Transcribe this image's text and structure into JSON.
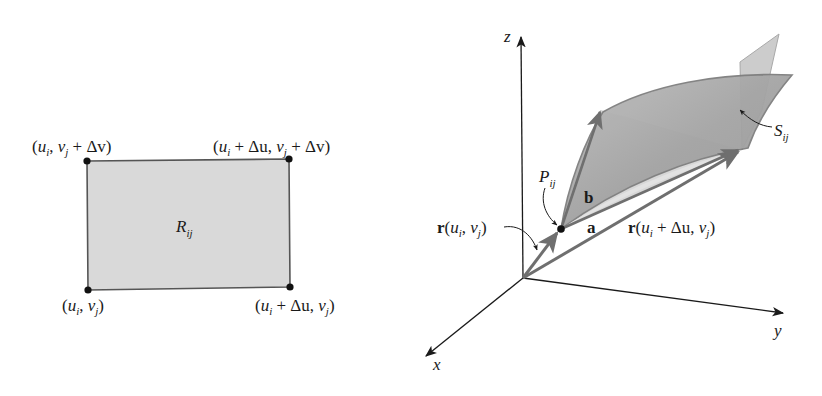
{
  "colors": {
    "ink": "#1a1a1a",
    "rect_fill": "#d9d9d9",
    "rect_stroke": "#555555",
    "surface_fill": "#a9a9a9",
    "surface_back_fill": "#c6c6c6",
    "tangent_fill": "#d0d0d0",
    "vector_gray": "#7a7a7a"
  },
  "left_panel": {
    "region_label": "R",
    "region_sub": "ij",
    "corners": {
      "top_left": {
        "open": "(",
        "u": "u",
        "u_sub": "i",
        "comma": ", ",
        "v": "v",
        "v_sub": "j",
        "rest": " + Δv)"
      },
      "top_right": {
        "open": "(",
        "u": "u",
        "u_sub": "i",
        "mid": " + Δu, ",
        "v": "v",
        "v_sub": "j",
        "rest": " + Δv)"
      },
      "bottom_left": {
        "open": "(",
        "u": "u",
        "u_sub": "i",
        "comma": ", ",
        "v": "v",
        "v_sub": "j",
        "rest": ")"
      },
      "bottom_right": {
        "open": "(",
        "u": "u",
        "u_sub": "i",
        "mid": " + Δu, ",
        "v": "v",
        "v_sub": "j",
        "rest": ")"
      }
    }
  },
  "right_panel": {
    "axes": {
      "x": "x",
      "y": "y",
      "z": "z"
    },
    "point_label": "P",
    "point_sub": "ij",
    "surface_label": "S",
    "surface_sub": "ij",
    "vector_a": "a",
    "vector_b": "b",
    "position_vector": {
      "r": "r",
      "open": "(",
      "u": "u",
      "u_sub": "i",
      "comma": ", ",
      "v": "v",
      "v_sub": "j",
      "close": ")"
    },
    "shifted_vector": {
      "r": "r",
      "open": "(",
      "u": "u",
      "u_sub": "i",
      "mid": " + Δu, ",
      "v": "v",
      "v_sub": "j",
      "close": ")"
    }
  }
}
